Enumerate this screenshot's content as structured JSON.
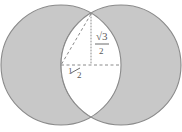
{
  "figure": {
    "canvas": {
      "width": 182,
      "height": 132,
      "background": "#ffffff"
    },
    "colors": {
      "circle_fill": "#c8c8c8",
      "circle_stroke": "#8a8a8a",
      "lens_fill": "#ffffff",
      "label_color": "#5a5a5a",
      "dash_color": "#8a8a8a",
      "dot_color": "#8a8a8a"
    },
    "shapes": {
      "left_circle": {
        "cx": 61,
        "cy": 65,
        "r": 60,
        "name": "left-circle"
      },
      "right_circle": {
        "cx": 121,
        "cy": 65,
        "r": 60,
        "name": "right-circle"
      },
      "lens": {
        "top_point_x": 91,
        "top_point_y": 14,
        "bottom_point_x": 91,
        "bottom_point_y": 115,
        "name": "lens-intersection"
      }
    },
    "construction_lines": [
      {
        "name": "vertical-dotted-altitude",
        "style": "dotted",
        "x1": 91,
        "y1": 14,
        "x2": 91,
        "y2": 65
      },
      {
        "name": "horizontal-dashed-radius",
        "style": "dashed",
        "x1": 61,
        "y1": 65,
        "x2": 121,
        "y2": 65
      },
      {
        "name": "diagonal-dashed-hypotenuse",
        "style": "dashed",
        "x1": 91,
        "y1": 14,
        "x2": 61,
        "y2": 65
      }
    ],
    "labels": {
      "height_label": {
        "name": "sqrt-three-over-two-label",
        "numerator": "√3",
        "denominator": "2",
        "plain": "√3/2",
        "x": 100,
        "y": 40
      },
      "base_label": {
        "name": "one-half-label",
        "numerator": "1",
        "denominator": "2",
        "plain": "1/2",
        "x": 73,
        "y": 74
      }
    }
  }
}
